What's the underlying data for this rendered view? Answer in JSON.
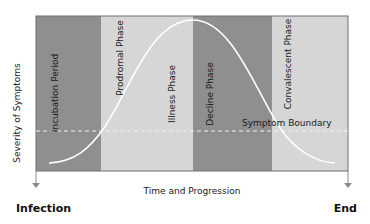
{
  "axes": {
    "y_label": "Severity of Symptoms",
    "x_label": "Time and Progression",
    "start_label": "Infection",
    "end_label": "End"
  },
  "boundary": {
    "label": "Symptom Boundary"
  },
  "phases": [
    {
      "label": "Incubation Period",
      "shade": "dark"
    },
    {
      "label": "Prodromal Phase",
      "shade": "light"
    },
    {
      "label": "Illness Phase",
      "shade": "light"
    },
    {
      "label": "Decline Phase",
      "shade": "dark"
    },
    {
      "label": "Convalescent Phase",
      "shade": "light"
    }
  ],
  "colors": {
    "dark_band": "#8f8f8f",
    "light_band": "#d6d6d6",
    "border": "#6e6e6e",
    "curve": "#ffffff",
    "arrow": "#8a8a8a"
  }
}
